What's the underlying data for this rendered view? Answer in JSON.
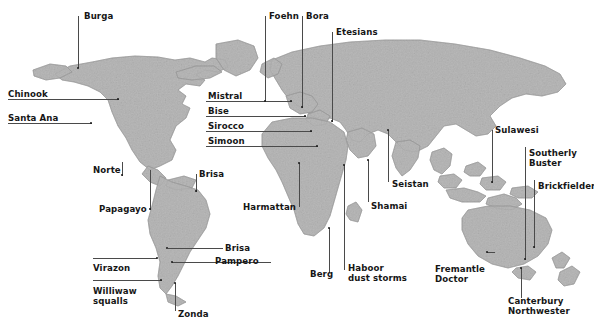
{
  "figure": {
    "kind": "world-map-wind-names",
    "background_color": "#ffffff",
    "land_color": "#b9b9b9",
    "land_edge_color": "#8c8c8c",
    "text_color": "#161616",
    "leader_color": "#4a4a4a",
    "width": 594,
    "height": 328
  },
  "labels": [
    {
      "name": "burga",
      "text": "Burga",
      "x": 84,
      "y": 12,
      "align": "left"
    },
    {
      "name": "foehn",
      "text": "Foehn",
      "x": 269,
      "y": 12,
      "align": "left"
    },
    {
      "name": "bora",
      "text": "Bora",
      "x": 306,
      "y": 12,
      "align": "left"
    },
    {
      "name": "etesians",
      "text": "Etesians",
      "x": 336,
      "y": 28,
      "align": "left"
    },
    {
      "name": "chinook",
      "text": "Chinook",
      "x": 8,
      "y": 90,
      "align": "left"
    },
    {
      "name": "santa-ana",
      "text": "Santa Ana",
      "x": 8,
      "y": 114,
      "align": "left"
    },
    {
      "name": "mistral",
      "text": "Mistral",
      "x": 208,
      "y": 92,
      "align": "left"
    },
    {
      "name": "bise",
      "text": "Bise",
      "x": 208,
      "y": 107,
      "align": "left"
    },
    {
      "name": "sirocco",
      "text": "Sirocco",
      "x": 208,
      "y": 122,
      "align": "left"
    },
    {
      "name": "simoon",
      "text": "Simoon",
      "x": 208,
      "y": 137,
      "align": "left"
    },
    {
      "name": "sulawesi",
      "text": "Sulawesi",
      "x": 495,
      "y": 126,
      "align": "left"
    },
    {
      "name": "southerly-buster",
      "text": "Southerly\nBuster",
      "x": 529,
      "y": 149,
      "align": "left"
    },
    {
      "name": "brickfielder",
      "text": "Brickfielder",
      "x": 538,
      "y": 182,
      "align": "left"
    },
    {
      "name": "norte",
      "text": "Norte",
      "x": 93,
      "y": 166,
      "align": "left"
    },
    {
      "name": "brisa-north",
      "text": "Brisa",
      "x": 199,
      "y": 170,
      "align": "left"
    },
    {
      "name": "seistan",
      "text": "Seistan",
      "x": 392,
      "y": 180,
      "align": "left"
    },
    {
      "name": "papagayo",
      "text": "Papagayo",
      "x": 99,
      "y": 205,
      "align": "left"
    },
    {
      "name": "harmattan",
      "text": "Harmattan",
      "x": 243,
      "y": 203,
      "align": "left"
    },
    {
      "name": "shamai",
      "text": "Shamai",
      "x": 371,
      "y": 202,
      "align": "left"
    },
    {
      "name": "brisa-south",
      "text": "Brisa",
      "x": 225,
      "y": 244,
      "align": "left"
    },
    {
      "name": "pampero",
      "text": "Pampero",
      "x": 215,
      "y": 257,
      "align": "left"
    },
    {
      "name": "virazon",
      "text": "Virazon",
      "x": 93,
      "y": 264,
      "align": "left"
    },
    {
      "name": "fremantle-doctor",
      "text": "Fremantle\nDoctor",
      "x": 435,
      "y": 265,
      "align": "left"
    },
    {
      "name": "berg",
      "text": "Berg",
      "x": 310,
      "y": 270,
      "align": "left"
    },
    {
      "name": "haboor-dust-storms",
      "text": "Haboor\ndust storms",
      "x": 348,
      "y": 264,
      "align": "left"
    },
    {
      "name": "williwaw-squalls",
      "text": "Williwaw\nsqualls",
      "x": 93,
      "y": 287,
      "align": "left"
    },
    {
      "name": "zonda",
      "text": "Zonda",
      "x": 178,
      "y": 310,
      "align": "left"
    },
    {
      "name": "canterbury-northwester",
      "text": "Canterbury\nNorthwester",
      "x": 508,
      "y": 297,
      "align": "left"
    }
  ],
  "leaders": [
    {
      "name": "leader-burga",
      "orient": "v",
      "x": 78,
      "y": 16,
      "len": 52
    },
    {
      "name": "leader-foehn",
      "orient": "v",
      "x": 265,
      "y": 16,
      "len": 86
    },
    {
      "name": "leader-bora",
      "orient": "v",
      "x": 302,
      "y": 16,
      "len": 92
    },
    {
      "name": "leader-etesians",
      "orient": "v",
      "x": 332,
      "y": 32,
      "len": 90
    },
    {
      "name": "leader-chinook",
      "orient": "h",
      "x": 8,
      "y": 99,
      "len": 111
    },
    {
      "name": "leader-santa-ana",
      "orient": "h",
      "x": 8,
      "y": 123,
      "len": 84
    },
    {
      "name": "leader-mistral",
      "orient": "h",
      "x": 206,
      "y": 101,
      "len": 86
    },
    {
      "name": "leader-bise",
      "orient": "h",
      "x": 206,
      "y": 116,
      "len": 100
    },
    {
      "name": "leader-sirocco",
      "orient": "h",
      "x": 206,
      "y": 131,
      "len": 106
    },
    {
      "name": "leader-simoon",
      "orient": "h",
      "x": 206,
      "y": 146,
      "len": 112
    },
    {
      "name": "leader-sulawesi",
      "orient": "v",
      "x": 492,
      "y": 130,
      "len": 53
    },
    {
      "name": "leader-southerly-buster",
      "orient": "v",
      "x": 525,
      "y": 147,
      "len": 113
    },
    {
      "name": "leader-brickfielder",
      "orient": "v",
      "x": 534,
      "y": 180,
      "len": 68
    },
    {
      "name": "leader-norte",
      "orient": "v",
      "x": 122,
      "y": 162,
      "len": 14
    },
    {
      "name": "leader-brisa-north",
      "orient": "v",
      "x": 196,
      "y": 174,
      "len": 18
    },
    {
      "name": "leader-seistan",
      "orient": "v",
      "x": 388,
      "y": 130,
      "len": 52
    },
    {
      "name": "leader-papagayo",
      "orient": "v",
      "x": 150,
      "y": 170,
      "len": 40
    },
    {
      "name": "leader-harmattan",
      "orient": "v",
      "x": 299,
      "y": 163,
      "len": 44
    },
    {
      "name": "leader-shamai",
      "orient": "v",
      "x": 368,
      "y": 160,
      "len": 42
    },
    {
      "name": "leader-brisa-south",
      "orient": "h",
      "x": 168,
      "y": 248,
      "len": 55
    },
    {
      "name": "leader-pampero",
      "orient": "h",
      "x": 172,
      "y": 262,
      "len": 99
    },
    {
      "name": "leader-virazon",
      "orient": "h",
      "x": 93,
      "y": 258,
      "len": 64
    },
    {
      "name": "leader-fremantle-doctor",
      "orient": "h",
      "x": 487,
      "y": 252,
      "len": 8
    },
    {
      "name": "leader-berg",
      "orient": "v",
      "x": 329,
      "y": 228,
      "len": 45
    },
    {
      "name": "leader-haboor",
      "orient": "v",
      "x": 344,
      "y": 165,
      "len": 105
    },
    {
      "name": "leader-williwaw",
      "orient": "h",
      "x": 93,
      "y": 280,
      "len": 69
    },
    {
      "name": "leader-zonda",
      "orient": "v",
      "x": 175,
      "y": 283,
      "len": 28
    },
    {
      "name": "leader-canterbury",
      "orient": "v",
      "x": 521,
      "y": 268,
      "len": 30
    }
  ],
  "markers": [
    {
      "name": "marker-burga",
      "x": 78,
      "y": 68
    },
    {
      "name": "marker-chinook",
      "x": 118,
      "y": 99
    },
    {
      "name": "marker-santa-ana",
      "x": 91,
      "y": 123
    },
    {
      "name": "marker-mistral",
      "x": 291,
      "y": 101
    },
    {
      "name": "marker-bise",
      "x": 305,
      "y": 116
    },
    {
      "name": "marker-sirocco",
      "x": 311,
      "y": 131
    },
    {
      "name": "marker-simoon",
      "x": 317,
      "y": 146
    },
    {
      "name": "marker-foehn",
      "x": 265,
      "y": 101
    },
    {
      "name": "marker-bora",
      "x": 302,
      "y": 107
    },
    {
      "name": "marker-etesians",
      "x": 332,
      "y": 121
    },
    {
      "name": "marker-norte",
      "x": 122,
      "y": 175
    },
    {
      "name": "marker-papagayo",
      "x": 150,
      "y": 209
    },
    {
      "name": "marker-brisa-n",
      "x": 196,
      "y": 191
    },
    {
      "name": "marker-brisa-s",
      "x": 167,
      "y": 248
    },
    {
      "name": "marker-pampero",
      "x": 172,
      "y": 262
    },
    {
      "name": "marker-virazon",
      "x": 157,
      "y": 258
    },
    {
      "name": "marker-williwaw",
      "x": 161,
      "y": 280
    },
    {
      "name": "marker-zonda",
      "x": 175,
      "y": 283
    },
    {
      "name": "marker-harmattan",
      "x": 299,
      "y": 163
    },
    {
      "name": "marker-berg",
      "x": 329,
      "y": 228
    },
    {
      "name": "marker-haboor",
      "x": 344,
      "y": 165
    },
    {
      "name": "marker-shamai",
      "x": 368,
      "y": 160
    },
    {
      "name": "marker-seistan",
      "x": 388,
      "y": 130
    },
    {
      "name": "marker-sulawesi",
      "x": 492,
      "y": 182
    },
    {
      "name": "marker-sbuster",
      "x": 525,
      "y": 259
    },
    {
      "name": "marker-brickfield",
      "x": 534,
      "y": 247
    },
    {
      "name": "marker-fremantle",
      "x": 487,
      "y": 252
    },
    {
      "name": "marker-canterbury",
      "x": 521,
      "y": 268
    }
  ]
}
